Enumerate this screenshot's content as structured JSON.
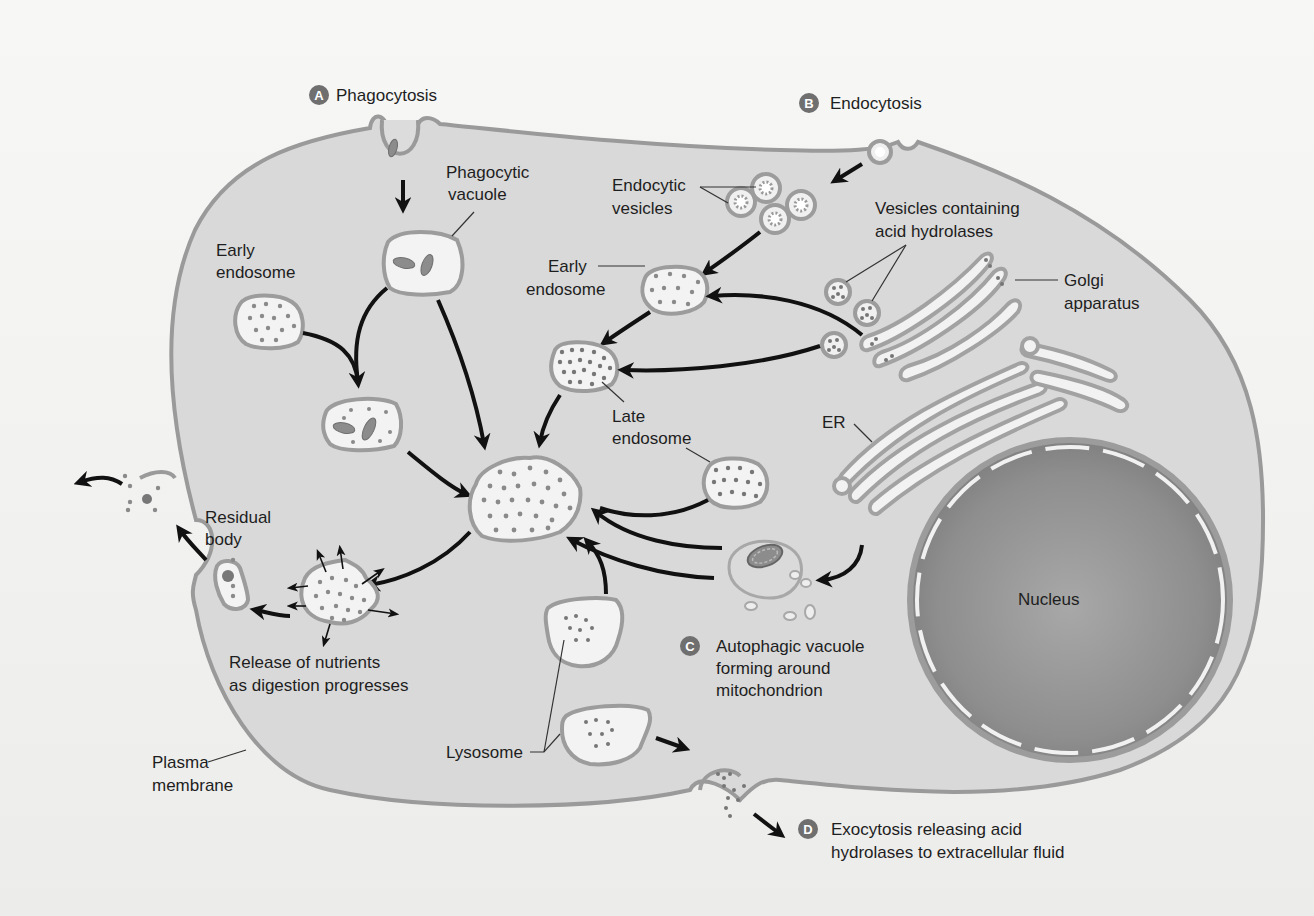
{
  "figure": {
    "type": "lysosome-pathways-cell-diagram",
    "colors": {
      "background": "#f3f3f2",
      "cytoplasm": "#d9d9d9",
      "membrane": "#9a9a9a",
      "vesicle_fill": "#f3f3f3",
      "nucleus": "#8f8f8f",
      "badge": "#6f6f6f",
      "arrow": "#111111",
      "text": "#1e1e1e"
    }
  },
  "processes": {
    "a": {
      "badge": "A",
      "label": "Phagocytosis"
    },
    "b": {
      "badge": "B",
      "label": "Endocytosis"
    },
    "c": {
      "badge": "C",
      "line1": "Autophagic vacuole",
      "line2": "forming around",
      "line3": "mitochondrion"
    },
    "d": {
      "badge": "D",
      "line1": "Exocytosis releasing acid",
      "line2": "hydrolases to extracellular fluid"
    }
  },
  "labels": {
    "phagocytic_vacuole": {
      "line1": "Phagocytic",
      "line2": "vacuole"
    },
    "early_endosome_left": {
      "line1": "Early",
      "line2": "endosome"
    },
    "early_endosome_right": {
      "line1": "Early",
      "line2": "endosome"
    },
    "endocytic_vesicles": {
      "line1": "Endocytic",
      "line2": "vesicles"
    },
    "vesicles_acid_hydrolases": {
      "line1": "Vesicles containing",
      "line2": "acid hydrolases"
    },
    "golgi": {
      "line1": "Golgi",
      "line2": "apparatus"
    },
    "late_endosome": {
      "line1": "Late",
      "line2": "endosome"
    },
    "er": "ER",
    "nucleus": "Nucleus",
    "residual_body": {
      "line1": "Residual",
      "line2": "body"
    },
    "release_nutrients": {
      "line1": "Release of nutrients",
      "line2": "as digestion progresses"
    },
    "lysosome": "Lysosome",
    "plasma_membrane": {
      "line1": "Plasma",
      "line2": "membrane"
    }
  }
}
